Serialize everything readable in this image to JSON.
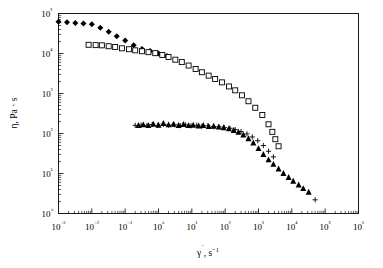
{
  "chart_data": {
    "type": "scatter",
    "title": "",
    "xlabel": "γ̇, s⁻¹",
    "ylabel": "η, Pa · s",
    "xscale": "log",
    "yscale": "log",
    "xlim": [
      0.001,
      1000000
    ],
    "ylim": [
      1,
      100000
    ],
    "grid": false,
    "legend": "none",
    "x_tick_labels": [
      "10⁻³",
      "10⁻²",
      "10⁻¹",
      "10⁰",
      "10¹",
      "10²",
      "10³",
      "10⁴",
      "10⁵",
      "10⁶"
    ],
    "x_tick_values": [
      0.001,
      0.01,
      0.1,
      1,
      10,
      100,
      1000,
      10000,
      100000,
      1000000
    ],
    "y_tick_labels": [
      "10⁰",
      "10¹",
      "10²",
      "10³",
      "10⁴",
      "10⁵"
    ],
    "y_tick_values": [
      1,
      10,
      100,
      1000,
      10000,
      100000
    ],
    "series": [
      {
        "name": "filled-diamond-series",
        "marker": "diamond-filled",
        "points": [
          [
            0.001,
            62000
          ],
          [
            0.0018,
            60000
          ],
          [
            0.0032,
            58000
          ],
          [
            0.0056,
            56000
          ],
          [
            0.01,
            54000
          ],
          [
            0.018,
            44000
          ],
          [
            0.032,
            35000
          ],
          [
            0.056,
            27000
          ],
          [
            0.1,
            21000
          ],
          [
            0.18,
            16000
          ],
          [
            0.32,
            13000
          ],
          [
            0.56,
            11500
          ],
          [
            1.0,
            10000
          ],
          [
            1.8,
            8600
          ]
        ]
      },
      {
        "name": "open-square-series",
        "marker": "square-open",
        "points": [
          [
            0.008,
            16500
          ],
          [
            0.013,
            16200
          ],
          [
            0.02,
            16000
          ],
          [
            0.032,
            15200
          ],
          [
            0.05,
            14500
          ],
          [
            0.08,
            13500
          ],
          [
            0.13,
            12800
          ],
          [
            0.2,
            12000
          ],
          [
            0.32,
            11400
          ],
          [
            0.5,
            10800
          ],
          [
            0.8,
            10200
          ],
          [
            1.3,
            9200
          ],
          [
            2.0,
            8200
          ],
          [
            3.2,
            7000
          ],
          [
            5.0,
            6100
          ],
          [
            8.0,
            5000
          ],
          [
            13.0,
            4100
          ],
          [
            20.0,
            3400
          ],
          [
            32.0,
            2800
          ],
          [
            50.0,
            2300
          ],
          [
            80.0,
            1900
          ],
          [
            130.0,
            1500
          ],
          [
            200.0,
            1200
          ],
          [
            320.0,
            900
          ],
          [
            500.0,
            640
          ],
          [
            800.0,
            440
          ],
          [
            1300.0,
            290
          ],
          [
            2000.0,
            170
          ],
          [
            2600.0,
            110
          ],
          [
            3200.0,
            72
          ],
          [
            4000.0,
            48
          ]
        ]
      },
      {
        "name": "filled-triangle-series",
        "marker": "triangle-filled",
        "points": [
          [
            0.25,
            160
          ],
          [
            0.35,
            165
          ],
          [
            0.5,
            158
          ],
          [
            0.7,
            172
          ],
          [
            1.0,
            162
          ],
          [
            1.4,
            178
          ],
          [
            2.0,
            165
          ],
          [
            2.8,
            170
          ],
          [
            4.0,
            160
          ],
          [
            5.6,
            168
          ],
          [
            8.0,
            158
          ],
          [
            11.0,
            162
          ],
          [
            16.0,
            155
          ],
          [
            22.0,
            160
          ],
          [
            32.0,
            150
          ],
          [
            45.0,
            152
          ],
          [
            64.0,
            145
          ],
          [
            90.0,
            140
          ],
          [
            130.0,
            132
          ],
          [
            180.0,
            120
          ],
          [
            250.0,
            108
          ],
          [
            350.0,
            92
          ],
          [
            500.0,
            74
          ],
          [
            700.0,
            58
          ],
          [
            1000.0,
            42
          ],
          [
            1400.0,
            30
          ],
          [
            2000.0,
            22
          ],
          [
            2800.0,
            17
          ],
          [
            4000.0,
            13
          ],
          [
            5600.0,
            10
          ],
          [
            8000.0,
            8.0
          ],
          [
            11000.0,
            6.4
          ],
          [
            16000.0,
            5.2
          ],
          [
            22000.0,
            4.2
          ],
          [
            32000.0,
            3.4
          ]
        ]
      },
      {
        "name": "plus-series",
        "marker": "plus",
        "points": [
          [
            0.2,
            160
          ],
          [
            0.3,
            162
          ],
          [
            0.45,
            160
          ],
          [
            0.65,
            168
          ],
          [
            0.95,
            160
          ],
          [
            1.4,
            170
          ],
          [
            2.0,
            162
          ],
          [
            3.0,
            166
          ],
          [
            4.5,
            158
          ],
          [
            6.5,
            164
          ],
          [
            9.5,
            156
          ],
          [
            14.0,
            160
          ],
          [
            20.0,
            152
          ],
          [
            30.0,
            156
          ],
          [
            45.0,
            148
          ],
          [
            65.0,
            148
          ],
          [
            95.0,
            140
          ],
          [
            140.0,
            135
          ],
          [
            200.0,
            125
          ],
          [
            300.0,
            112
          ],
          [
            450.0,
            98
          ],
          [
            650.0,
            82
          ],
          [
            950.0,
            66
          ],
          [
            1400.0,
            50
          ],
          [
            2000.0,
            36
          ],
          [
            2800.0,
            26
          ],
          [
            50000.0,
            2.2
          ]
        ]
      }
    ]
  },
  "axes": {
    "x_label_text": "γ̇, s⁻¹",
    "y_label_text": "η, Pa · s"
  }
}
